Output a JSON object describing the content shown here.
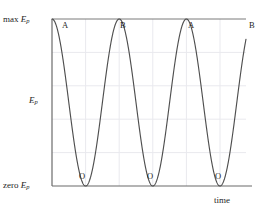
{
  "figure": {
    "type": "energy-vs-time-graph",
    "axes": {
      "y_top_label_prefix": "max",
      "y_top_label_symbol": "E",
      "y_top_label_subscript": "p",
      "y_mid_label_symbol": "E",
      "y_mid_label_subscript": "p",
      "y_bottom_label_prefix": "zero",
      "y_bottom_label_symbol": "E",
      "y_bottom_label_subscript": "p",
      "x_label": "time"
    },
    "curve_color": "#4a4a4a",
    "axis_color": "#6b6b6b",
    "grid_color": "#e8e8ec"
  },
  "point_labels": [
    {
      "text": "A",
      "x": 62,
      "y": 21
    },
    {
      "text": "B",
      "x": 120,
      "y": 21
    },
    {
      "text": "A",
      "x": 188,
      "y": 21
    },
    {
      "text": "B",
      "x": 249,
      "y": 21
    },
    {
      "text": "O",
      "x": 79,
      "y": 172
    },
    {
      "text": "O",
      "x": 147,
      "y": 172
    },
    {
      "text": "O",
      "x": 215,
      "y": 172
    }
  ],
  "chart_data": {
    "type": "line",
    "title": "",
    "xlabel": "time",
    "ylabel": "Ep",
    "ylim": [
      0,
      1
    ],
    "ytick_labels": [
      "zero Ep",
      "Ep",
      "max Ep"
    ],
    "ytick_values": [
      0,
      0.5,
      1
    ],
    "grid": true,
    "legend": null,
    "series": [
      {
        "name": "Ep",
        "form": "cos^2",
        "amplitude": 1,
        "baseline": 0,
        "period_units": 2,
        "phase": "starts at maximum",
        "x": [
          0.0,
          0.1,
          0.2,
          0.3,
          0.4,
          0.5,
          0.6,
          0.7,
          0.8,
          0.9,
          1.0,
          1.1,
          1.2,
          1.3,
          1.4,
          1.5,
          1.6,
          1.7,
          1.8,
          1.9,
          2.0,
          2.1,
          2.2,
          2.3,
          2.4,
          2.5,
          2.6,
          2.7,
          2.8,
          2.9,
          3.0,
          3.1,
          3.2,
          3.3,
          3.4,
          3.5,
          3.6,
          3.7,
          3.8,
          3.9,
          4.0,
          4.1,
          4.2,
          4.3,
          4.4,
          4.5,
          4.6,
          4.7,
          4.8,
          4.9,
          5.0,
          5.1,
          5.2,
          5.3,
          5.4,
          5.5,
          5.6,
          5.7
        ],
        "values": [
          1.0,
          0.976,
          0.905,
          0.794,
          0.655,
          0.5,
          0.345,
          0.206,
          0.095,
          0.024,
          0.0,
          0.024,
          0.095,
          0.206,
          0.345,
          0.5,
          0.655,
          0.794,
          0.905,
          0.976,
          1.0,
          0.976,
          0.905,
          0.794,
          0.655,
          0.5,
          0.345,
          0.206,
          0.095,
          0.024,
          0.0,
          0.024,
          0.095,
          0.206,
          0.345,
          0.5,
          0.655,
          0.794,
          0.905,
          0.976,
          1.0,
          0.976,
          0.905,
          0.794,
          0.655,
          0.5,
          0.345,
          0.206,
          0.095,
          0.024,
          0.0,
          0.024,
          0.095,
          0.206,
          0.345,
          0.5,
          0.655,
          0.794
        ]
      }
    ],
    "annotations": [
      {
        "label": "A",
        "at": "maximum Ep at t=0"
      },
      {
        "label": "O",
        "at": "zero Ep at t=1"
      },
      {
        "label": "B",
        "at": "maximum Ep at t=2"
      },
      {
        "label": "O",
        "at": "zero Ep at t=3"
      },
      {
        "label": "A",
        "at": "maximum Ep at t=4"
      },
      {
        "label": "O",
        "at": "zero Ep at t=5"
      },
      {
        "label": "B",
        "at": "maximum Ep at t=6"
      }
    ]
  }
}
